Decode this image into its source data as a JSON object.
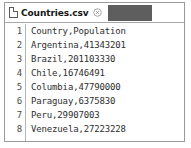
{
  "window": {
    "name": "text-editor-window",
    "background": "#ffffff",
    "border_color": "#9b9b9b"
  },
  "tab_bar": {
    "tabs": [
      {
        "label": "Countries.csv",
        "file_icon": "file-page-icon",
        "close_icon": "close-circle-icon",
        "active": true
      }
    ],
    "filler_color": "#5e5e5e"
  },
  "editor": {
    "gutter": {
      "line_numbers": [
        "1",
        "2",
        "3",
        "4",
        "5",
        "6",
        "7",
        "8"
      ],
      "text_color": "#4a4a4a"
    },
    "lines": [
      "Country,Population",
      "Argentina,41343201",
      "Brazil,201103330",
      "Chile,16746491",
      "Columbia,47790000",
      "Paraguay,6375830",
      "Peru,29907003",
      "Venezuela,27223228"
    ],
    "text_color": "#2e2e2e"
  }
}
